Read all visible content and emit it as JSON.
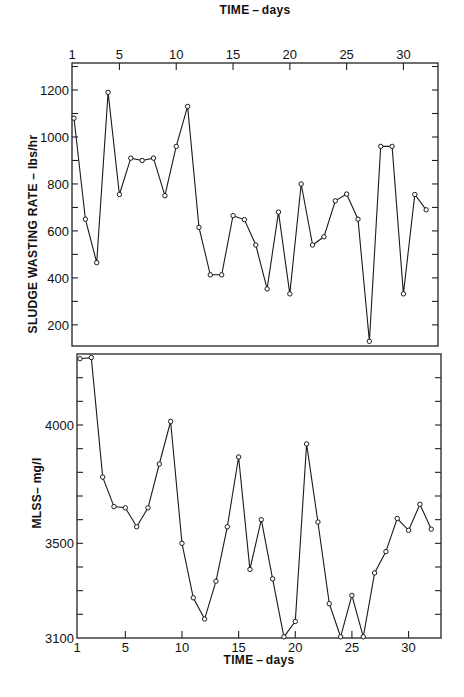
{
  "chart_data": [
    {
      "type": "line",
      "title": "",
      "xlabel": "TIME - days",
      "ylabel": "SLUDGE  WASTING RATE - lbs/hr",
      "xlabel_position": "top",
      "x_ticks": [
        1,
        5,
        10,
        15,
        20,
        25,
        30
      ],
      "y_ticks": [
        200,
        400,
        600,
        800,
        1000,
        1200
      ],
      "y_minor_step": 100,
      "xlim": [
        1,
        33
      ],
      "ylim": [
        110,
        1315
      ],
      "grid": false,
      "legend": null,
      "series": [
        {
          "name": "Sludge wasting rate",
          "x": [
            1,
            2,
            3,
            4,
            5,
            6,
            7,
            8,
            9,
            10,
            11,
            12,
            13,
            14,
            15,
            16,
            17,
            18,
            19,
            20,
            21,
            22,
            23,
            24,
            25,
            26,
            27,
            28,
            29,
            30,
            31,
            32
          ],
          "values": [
            1080,
            650,
            465,
            1190,
            755,
            910,
            900,
            910,
            750,
            960,
            1130,
            615,
            413,
            413,
            665,
            648,
            540,
            353,
            680,
            332,
            800,
            540,
            575,
            728,
            757,
            650,
            130,
            960,
            960,
            332,
            755,
            690
          ]
        }
      ]
    },
    {
      "type": "line",
      "title": "",
      "xlabel": "TIME - days",
      "ylabel": "MLSS - mg/l",
      "xlabel_position": "bottom",
      "x_ticks": [
        1,
        5,
        10,
        15,
        20,
        25,
        30
      ],
      "y_ticks": [
        3100,
        3500,
        4000
      ],
      "y_minor_step": 100,
      "xlim": [
        1,
        33
      ],
      "ylim": [
        3100,
        4300
      ],
      "grid": false,
      "legend": null,
      "series": [
        {
          "name": "MLSS",
          "x": [
            1,
            2,
            3,
            4,
            5,
            6,
            7,
            8,
            9,
            10,
            11,
            12,
            13,
            14,
            15,
            16,
            17,
            18,
            19,
            20,
            21,
            22,
            23,
            24,
            25,
            26,
            27,
            28,
            29,
            30,
            31,
            32
          ],
          "values": [
            4280,
            4285,
            3780,
            3655,
            3650,
            3570,
            3650,
            3835,
            4015,
            3500,
            3270,
            3180,
            3340,
            3570,
            3865,
            3390,
            3600,
            3350,
            3105,
            3170,
            3920,
            3590,
            3245,
            3105,
            3280,
            3105,
            3375,
            3465,
            3605,
            3555,
            3665,
            3560
          ]
        }
      ]
    }
  ],
  "labels": {
    "top_xlabel": "TIME – days",
    "top_ylabel": "SLUDGE  WASTING  RATE – lbs/hr",
    "bottom_xlabel": "TIME – days",
    "bottom_ylabel": "MLSS– mg/l"
  },
  "colors": {
    "ink": "#1a1a1a",
    "background": "#ffffff"
  }
}
